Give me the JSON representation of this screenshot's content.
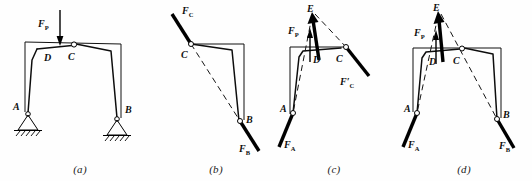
{
  "figure": {
    "width": 532,
    "height": 181,
    "background_color": "#fefefe",
    "line_color": "#000000"
  },
  "panels": [
    {
      "id": "a",
      "caption": "(a)",
      "description": "Three-hinged frame ABC with vertical load F_P applied near crown, pin supports at A and B",
      "labels": {
        "load": "F",
        "load_sub": "P",
        "point_a": "A",
        "point_b": "B",
        "point_c": "C",
        "point_d": "D"
      }
    },
    {
      "id": "b",
      "caption": "(b)",
      "description": "Free body of right half CB: forces F_C at hinge C and F_B at support B act along line CB",
      "labels": {
        "force_c": "F",
        "force_c_sub": "C",
        "force_b": "F",
        "force_b_sub": "B",
        "point_b": "B",
        "point_c": "C"
      }
    },
    {
      "id": "c",
      "caption": "(c)",
      "description": "Free body of left half AC: load F_P, reaction F_A at A and hinge force F'_C at C concurrent at point E",
      "labels": {
        "point_e": "E",
        "load": "F",
        "load_sub": "P",
        "force_a": "F",
        "force_a_sub": "A",
        "force_c_prime": "F′",
        "force_c_prime_sub": "C",
        "point_a": "A",
        "point_c": "C",
        "point_d": "D"
      }
    },
    {
      "id": "d",
      "caption": "(d)",
      "description": "Whole frame: three forces F_P, F_A and F_B concurrent at point E",
      "labels": {
        "point_e": "E",
        "load": "F",
        "load_sub": "P",
        "force_a": "F",
        "force_a_sub": "A",
        "force_b": "F",
        "force_b_sub": "B",
        "point_a": "A",
        "point_b": "B",
        "point_c": "C",
        "point_d": "D"
      }
    }
  ]
}
